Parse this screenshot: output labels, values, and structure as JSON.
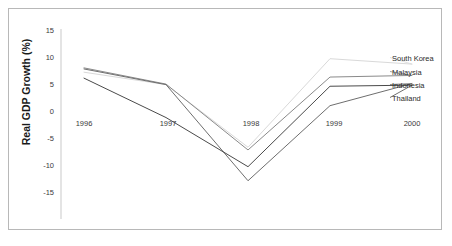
{
  "chart_data": {
    "type": "line",
    "title": "",
    "xlabel": "",
    "ylabel": "Real GDP Growth (%)",
    "categories": [
      "1996",
      "1997",
      "1998",
      "1999",
      "2000"
    ],
    "x": [
      1996,
      1997,
      1998,
      1999,
      2000
    ],
    "ylim": [
      -15,
      15
    ],
    "yticks": [
      15,
      10,
      5,
      0,
      -5,
      -10,
      -15
    ],
    "ytick_labels": [
      "15",
      "10",
      "5",
      "0",
      "-5",
      "-10",
      "-15"
    ],
    "xtick_labels": [
      "1996",
      "1997",
      "1998",
      "1999",
      "2000"
    ],
    "grid": false,
    "legend_position": "right-inline",
    "series": [
      {
        "name": "South Korea",
        "color": "#d9d9d9",
        "values": [
          7.0,
          4.7,
          -6.9,
          9.5,
          8.5
        ]
      },
      {
        "name": "Malaysia",
        "color": "#8a8a8a",
        "values": [
          7.8,
          4.8,
          -7.4,
          6.1,
          6.4
        ]
      },
      {
        "name": "Indonesia",
        "color": "#6e6e6e",
        "values": [
          7.6,
          4.7,
          -13.1,
          0.8,
          4.9
        ]
      },
      {
        "name": "Thailand",
        "color": "#4a4a4a",
        "values": [
          5.9,
          -1.4,
          -10.5,
          4.4,
          4.6
        ]
      }
    ],
    "annotations": [
      {
        "text": "South Korea",
        "series": "South Korea"
      },
      {
        "text": "Malaysia",
        "series": "Malaysia"
      },
      {
        "text": "Indonesia",
        "series": "Indonesia"
      },
      {
        "text": "Thailand",
        "series": "Thailand"
      }
    ]
  },
  "axis": {
    "y_axis_title": "Real GDP Growth (%)",
    "y_ticks": [
      "15",
      "10",
      "5",
      "0",
      "-5",
      "-10",
      "-15"
    ],
    "x_ticks": [
      "1996",
      "1997",
      "1998",
      "1999",
      "2000"
    ]
  },
  "legend": {
    "items": [
      {
        "label": "South Korea"
      },
      {
        "label": "Malaysia"
      },
      {
        "label": "Indonesia"
      },
      {
        "label": "Thailand"
      }
    ]
  }
}
